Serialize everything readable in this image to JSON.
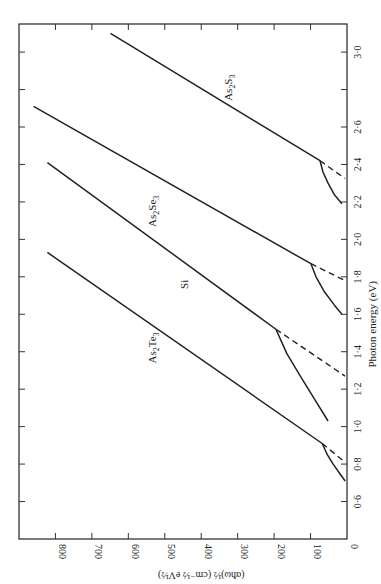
{
  "chart_data": {
    "type": "line",
    "title": "",
    "orientation": "rotated 90° (photon energy axis vertical on right, increasing upward; ordinate horizontal along bottom, increasing leftward)",
    "xlabel": "Photon energy (eV)",
    "ylabel": "(αħω)½ (cm⁻½ eV½)",
    "xlim": [
      0.4,
      3.15
    ],
    "ylim": [
      0,
      900
    ],
    "grid": false,
    "legend": "none (curves labelled inline)",
    "x_ticks": [
      0.6,
      0.8,
      1.0,
      1.2,
      1.4,
      1.6,
      1.8,
      2.0,
      2.2,
      2.4,
      2.6,
      2.8,
      3.0
    ],
    "x_tick_labels": [
      "0·6",
      "0·8",
      "1·0",
      "1·2",
      "1·4",
      "1·6",
      "1·8",
      "2·0",
      "2·2",
      "2·4",
      "2·6",
      "",
      "3·0"
    ],
    "y_ticks": [
      0,
      100,
      200,
      300,
      400,
      500,
      600,
      700,
      800
    ],
    "y_tick_labels": [
      "0",
      "100",
      "200",
      "300",
      "400",
      "500",
      "600",
      "700",
      "800"
    ],
    "series": [
      {
        "name": "As₂Te₃",
        "label_text": "As2Te3",
        "solid": {
          "x": [
            0.71,
            0.75,
            0.8,
            0.85,
            0.91,
            1.93
          ],
          "y": [
            5,
            20,
            38,
            54,
            68,
            822
          ]
        },
        "dashed_extrapolation": {
          "x": [
            0.91,
            0.81
          ],
          "y": [
            68,
            0
          ]
        },
        "optical_gap_eV": 0.81
      },
      {
        "name": "Si",
        "label_text": "Si",
        "solid": {
          "x": [
            1.03,
            1.15,
            1.27,
            1.39,
            1.52,
            2.41
          ],
          "y": [
            52,
            90,
            128,
            165,
            195,
            822
          ]
        },
        "dashed_extrapolation": {
          "x": [
            1.52,
            1.27
          ],
          "y": [
            195,
            0
          ]
        },
        "optical_gap_eV": 1.27
      },
      {
        "name": "As₂Se₃",
        "label_text": "As2Se3",
        "solid": {
          "x": [
            1.6,
            1.65,
            1.72,
            1.8,
            1.87,
            2.71
          ],
          "y": [
            14,
            35,
            62,
            85,
            99,
            860
          ]
        },
        "dashed_extrapolation": {
          "x": [
            1.87,
            1.78
          ],
          "y": [
            99,
            0
          ]
        },
        "optical_gap_eV": 1.78
      },
      {
        "name": "As₂S₃",
        "label_text": "As2S3",
        "solid": {
          "x": [
            2.19,
            2.24,
            2.3,
            2.36,
            2.42,
            3.1
          ],
          "y": [
            14,
            35,
            52,
            66,
            74,
            649
          ]
        },
        "dashed_extrapolation": {
          "x": [
            2.42,
            2.325
          ],
          "y": [
            74,
            0
          ]
        },
        "optical_gap_eV": 2.325
      }
    ],
    "annotations": [
      {
        "text": "As2S3",
        "x_eV": 2.81,
        "y_val": 315
      },
      {
        "text": "As2Se3",
        "x_eV": 2.15,
        "y_val": 525
      },
      {
        "text": "Si",
        "x_eV": 1.76,
        "y_val": 435
      },
      {
        "text": "As2Te3",
        "x_eV": 1.42,
        "y_val": 525
      }
    ]
  }
}
